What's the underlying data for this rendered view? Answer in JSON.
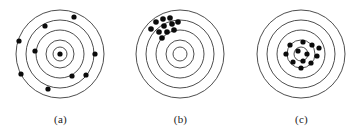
{
  "figure": {
    "title": "",
    "background_color": "#ffffff",
    "ring_color": "#3a3a3a",
    "shot_color": "#0b0b0b"
  },
  "chart_data": {
    "type": "scatter",
    "title": "",
    "subtitle": "",
    "xlabel": "",
    "ylabel": "",
    "grid": false,
    "legend": "none",
    "panels": [
      {
        "label": "(a)",
        "center": {
          "x": 60,
          "y": 50
        },
        "ring_radii": [
          44,
          34,
          24,
          14,
          7
        ],
        "pattern": "scattered",
        "shot_count": 10,
        "shot_radius": 2.6,
        "shots": [
          {
            "x": 74,
            "y": 13
          },
          {
            "x": 45,
            "y": 22
          },
          {
            "x": 19,
            "y": 37
          },
          {
            "x": 35,
            "y": 47
          },
          {
            "x": 95,
            "y": 50
          },
          {
            "x": 21,
            "y": 70
          },
          {
            "x": 72,
            "y": 72
          },
          {
            "x": 86,
            "y": 71
          },
          {
            "x": 48,
            "y": 85
          },
          {
            "x": 60,
            "y": 50
          }
        ]
      },
      {
        "label": "(b)",
        "center": {
          "x": 60,
          "y": 50
        },
        "ring_radii": [
          44,
          34,
          24,
          14,
          7
        ],
        "pattern": "clustered-off-center",
        "shot_count": 11,
        "shot_radius": 2.8,
        "shots": [
          {
            "x": 36,
            "y": 18
          },
          {
            "x": 43,
            "y": 15
          },
          {
            "x": 50,
            "y": 14
          },
          {
            "x": 44,
            "y": 22
          },
          {
            "x": 52,
            "y": 20
          },
          {
            "x": 58,
            "y": 18
          },
          {
            "x": 31,
            "y": 25
          },
          {
            "x": 39,
            "y": 28
          },
          {
            "x": 47,
            "y": 28
          },
          {
            "x": 54,
            "y": 26
          },
          {
            "x": 42,
            "y": 34
          }
        ]
      },
      {
        "label": "(c)",
        "center": {
          "x": 60,
          "y": 50
        },
        "ring_radii": [
          44,
          34,
          24,
          14,
          7
        ],
        "pattern": "clustered-on-center",
        "shot_count": 12,
        "shot_radius": 2.6,
        "shots": [
          {
            "x": 49,
            "y": 41
          },
          {
            "x": 62,
            "y": 38
          },
          {
            "x": 71,
            "y": 41
          },
          {
            "x": 78,
            "y": 44
          },
          {
            "x": 45,
            "y": 50
          },
          {
            "x": 57,
            "y": 47
          },
          {
            "x": 66,
            "y": 50
          },
          {
            "x": 76,
            "y": 52
          },
          {
            "x": 52,
            "y": 58
          },
          {
            "x": 62,
            "y": 57
          },
          {
            "x": 70,
            "y": 59
          },
          {
            "x": 60,
            "y": 64
          }
        ]
      }
    ]
  }
}
